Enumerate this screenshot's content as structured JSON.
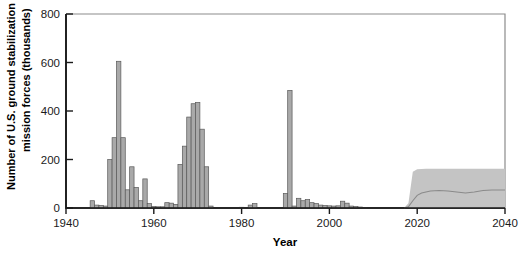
{
  "chart_data": {
    "type": "bar",
    "title": "",
    "xlabel": "Year",
    "ylabel": "Number of U.S. ground stabilization mission forces (thousands)",
    "xlim": [
      1940,
      2040
    ],
    "ylim": [
      0,
      800
    ],
    "xticks": [
      1940,
      1960,
      1980,
      2000,
      2020,
      2040
    ],
    "yticks": [
      0,
      200,
      400,
      600,
      800
    ],
    "grid": false,
    "legend": "none",
    "bar_color": "#a9a9a9",
    "bar_edge_color": "#595959",
    "band_color": "#c4c4c4",
    "median_color": "#8a8a8a",
    "series": [
      {
        "name": "Historical U.S. ground stabilization mission forces",
        "kind": "bar",
        "x": [
          1941,
          1942,
          1943,
          1944,
          1945,
          1946,
          1947,
          1948,
          1949,
          1950,
          1951,
          1952,
          1953,
          1954,
          1955,
          1956,
          1957,
          1958,
          1959,
          1960,
          1961,
          1962,
          1963,
          1964,
          1965,
          1966,
          1967,
          1968,
          1969,
          1970,
          1971,
          1972,
          1973,
          1974,
          1975,
          1976,
          1977,
          1978,
          1979,
          1980,
          1981,
          1982,
          1983,
          1984,
          1985,
          1986,
          1987,
          1988,
          1989,
          1990,
          1991,
          1992,
          1993,
          1994,
          1995,
          1996,
          1997,
          1998,
          1999,
          2000,
          2001,
          2002,
          2003,
          2004,
          2005,
          2006,
          2007,
          2008
        ],
        "values": [
          0,
          0,
          0,
          0,
          0,
          30,
          12,
          10,
          8,
          200,
          290,
          605,
          290,
          75,
          170,
          85,
          30,
          120,
          18,
          6,
          5,
          5,
          22,
          20,
          15,
          180,
          255,
          375,
          430,
          435,
          325,
          170,
          8,
          0,
          0,
          0,
          0,
          0,
          0,
          3,
          0,
          12,
          18,
          0,
          0,
          0,
          0,
          0,
          0,
          60,
          485,
          8,
          40,
          30,
          35,
          22,
          18,
          12,
          10,
          9,
          8,
          9,
          28,
          20,
          8,
          6,
          4,
          2
        ]
      },
      {
        "name": "Projected demand (range)",
        "kind": "band",
        "x": [
          2017,
          2018,
          2019,
          2020,
          2022,
          2025,
          2030,
          2035,
          2040
        ],
        "upper": [
          0,
          20,
          150,
          160,
          162,
          162,
          162,
          162,
          162
        ],
        "lower": [
          0,
          0,
          0,
          0,
          0,
          0,
          0,
          0,
          0
        ]
      },
      {
        "name": "Projected demand (median)",
        "kind": "line",
        "x": [
          2017,
          2018,
          2019,
          2020,
          2021,
          2023,
          2025,
          2027,
          2029,
          2031,
          2033,
          2035,
          2037,
          2040
        ],
        "values": [
          0,
          5,
          30,
          52,
          62,
          70,
          72,
          70,
          66,
          62,
          66,
          72,
          74,
          74
        ]
      }
    ],
    "annotations": []
  },
  "axes": {
    "y_title": "Number of U.S. ground stabilization mission forces (thousands)",
    "y_title_line1": "Number of U.S. ground stabilization",
    "y_title_line2": "mission forces (thousands)",
    "x_title": "Year",
    "y_tick_labels": [
      "0",
      "200",
      "400",
      "600",
      "800"
    ],
    "x_tick_labels": [
      "1940",
      "1960",
      "1980",
      "2000",
      "2020",
      "2040"
    ]
  }
}
